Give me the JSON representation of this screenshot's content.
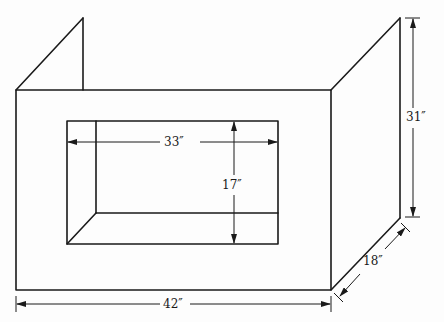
{
  "diagram": {
    "dimensions": {
      "opening_width": "33″",
      "opening_height": "17″",
      "panel_height": "31″",
      "total_width": "42″",
      "side_depth": "18″"
    },
    "colors": {
      "line": "#1a1a1a",
      "background": "#fdfdfd"
    }
  }
}
